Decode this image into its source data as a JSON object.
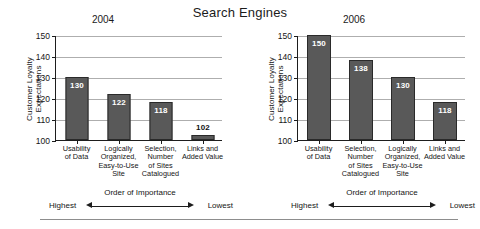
{
  "title": "Search Engines",
  "axis": {
    "y_title": "Customer Loyalty Expectations",
    "ticks": [
      "150",
      "140",
      "130",
      "120",
      "110",
      "100"
    ],
    "order_title": "Order of Importance",
    "order_high": "Highest",
    "order_low": "Lowest"
  },
  "panels": [
    {
      "year": "2004",
      "values": [
        "130",
        "122",
        "118",
        "102"
      ],
      "categories": [
        "Usability\nof Data",
        "Logically\nOrganized,\nEasy-to-Use\nSite",
        "Selection,\nNumber\nof Sites\nCatalogued",
        "Links and\nAdded Value"
      ]
    },
    {
      "year": "2006",
      "values": [
        "150",
        "138",
        "130",
        "118"
      ],
      "categories": [
        "Usability\nof Data",
        "Selection,\nNumber\nof Sites\nCatalogued",
        "Logically\nOrganized,\nEasy-to-Use\nSite",
        "Links and\nAdded Value"
      ]
    }
  ],
  "colors": {
    "bar": "#595959",
    "bar_border": "#2a2a2a",
    "grid": "#aeaeae",
    "axis": "#1d1d1d"
  },
  "chart_data": [
    {
      "type": "bar",
      "title": "Search Engines",
      "subtitle": "2004",
      "categories": [
        "Usability of Data",
        "Logically Organized, Easy-to-Use Site",
        "Selection, Number of Sites Catalogued",
        "Links and Added Value"
      ],
      "values": [
        130,
        122,
        118,
        102
      ],
      "xlabel": "Order of Importance",
      "ylabel": "Customer Loyalty Expectations",
      "ylim": [
        100,
        150
      ],
      "yticks": [
        100,
        110,
        120,
        130,
        140,
        150
      ],
      "grid": true,
      "legend": "none",
      "annotations": [
        "Highest",
        "Lowest"
      ]
    },
    {
      "type": "bar",
      "title": "Search Engines",
      "subtitle": "2006",
      "categories": [
        "Usability of Data",
        "Selection, Number of Sites Catalogued",
        "Logically Organized, Easy-to-Use Site",
        "Links and Added Value"
      ],
      "values": [
        150,
        138,
        130,
        118
      ],
      "xlabel": "Order of Importance",
      "ylabel": "Customer Loyalty Expectations",
      "ylim": [
        100,
        150
      ],
      "yticks": [
        100,
        110,
        120,
        130,
        140,
        150
      ],
      "grid": true,
      "legend": "none",
      "annotations": [
        "Highest",
        "Lowest"
      ]
    }
  ]
}
